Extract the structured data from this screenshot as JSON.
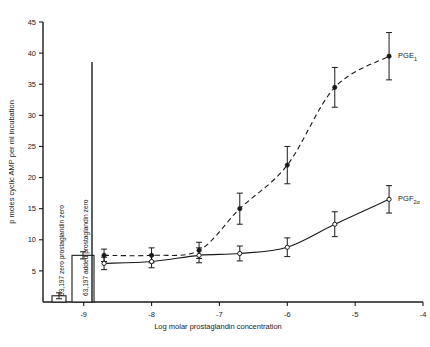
{
  "chart_data": {
    "type": "line",
    "title": "",
    "xlabel": "Log molar prostaglandin concentration",
    "ylabel": "p moles cyclic AMP per ml incubation",
    "xlim": [
      -9.6,
      -4.0
    ],
    "ylim": [
      0,
      45
    ],
    "yticks": [
      5,
      10,
      15,
      20,
      25,
      30,
      35,
      40,
      45
    ],
    "xticks": [
      -9,
      -8,
      -7,
      -6,
      -5,
      -4
    ],
    "xticklabels": [
      "-9",
      "-8",
      "-7",
      "-6",
      "-5",
      "-4"
    ],
    "yticklabels": [
      "5",
      "10",
      "15",
      "20",
      "25",
      "30",
      "35",
      "40",
      "45"
    ],
    "grid": false,
    "legend_position": "inline-right-of-curve",
    "series": [
      {
        "name": "PGE1",
        "label": "PGE",
        "label_sub": "1",
        "marker": "filled-circle",
        "line": "dashed",
        "x": [
          -8.7,
          -8.0,
          -7.3,
          -6.7,
          -6.0,
          -5.3,
          -4.5
        ],
        "values": [
          7.5,
          7.5,
          8.3,
          15.0,
          22.0,
          34.5,
          39.5
        ],
        "errors": [
          1.0,
          1.2,
          1.3,
          2.5,
          3.0,
          3.2,
          3.8
        ]
      },
      {
        "name": "PGF2alpha",
        "label": "PGF",
        "label_sub": "2",
        "label_sub2": "α",
        "marker": "open-circle",
        "line": "solid",
        "x": [
          -8.7,
          -8.0,
          -7.3,
          -6.7,
          -6.0,
          -5.3,
          -4.5
        ],
        "values": [
          6.2,
          6.5,
          7.5,
          7.8,
          8.8,
          12.5,
          16.5
        ],
        "errors": [
          1.0,
          1.0,
          1.2,
          1.2,
          1.5,
          2.0,
          2.2
        ]
      }
    ],
    "bars": [
      {
        "label": "63,197 zero prostaglandin zero",
        "value": 1.0,
        "error": 0.5
      },
      {
        "label": "63,197 added prostaglandin zero",
        "value": 7.5,
        "error": 0.6
      }
    ]
  }
}
